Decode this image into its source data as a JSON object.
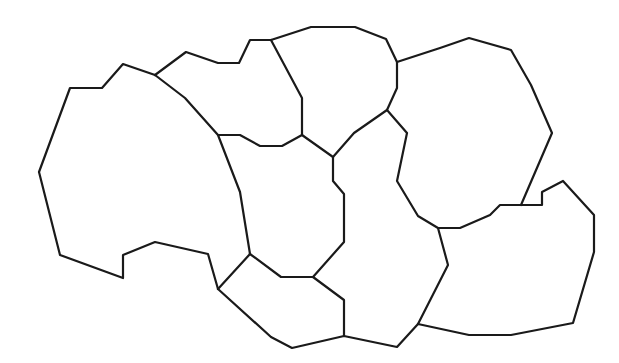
{
  "diagram": {
    "type": "region-outline-map",
    "width": 619,
    "height": 363,
    "background": "#ffffff",
    "stroke_color": "#1a1a1a",
    "segments": [
      {
        "name": "outer-west-boundary",
        "points": [
          [
            155,
            75
          ],
          [
            123,
            64
          ],
          [
            102,
            88
          ],
          [
            70,
            88
          ],
          [
            39,
            172
          ],
          [
            60,
            255
          ],
          [
            123,
            278
          ],
          [
            123,
            255
          ],
          [
            155,
            242
          ],
          [
            208,
            254
          ],
          [
            218,
            289
          ]
        ]
      },
      {
        "name": "west-east-divider",
        "points": [
          [
            155,
            75
          ],
          [
            185,
            98
          ],
          [
            218,
            135
          ],
          [
            240,
            192
          ],
          [
            250,
            254
          ]
        ]
      },
      {
        "name": "outer-north-west-boundary",
        "points": [
          [
            155,
            75
          ],
          [
            186,
            52
          ],
          [
            218,
            63
          ],
          [
            239,
            63
          ],
          [
            250,
            40
          ],
          [
            271,
            40
          ]
        ]
      },
      {
        "name": "north-region-divider",
        "points": [
          [
            271,
            40
          ],
          [
            302,
            98
          ],
          [
            302,
            135
          ]
        ]
      },
      {
        "name": "north-region-bottom",
        "points": [
          [
            218,
            135
          ],
          [
            240,
            135
          ],
          [
            260,
            146
          ],
          [
            282,
            146
          ],
          [
            302,
            135
          ]
        ]
      },
      {
        "name": "outer-north-boundary",
        "points": [
          [
            271,
            40
          ],
          [
            311,
            27
          ],
          [
            355,
            27
          ],
          [
            386,
            39
          ],
          [
            397,
            62
          ]
        ]
      },
      {
        "name": "outer-north-east-boundary",
        "points": [
          [
            397,
            62
          ],
          [
            440,
            48
          ],
          [
            469,
            38
          ],
          [
            511,
            50
          ],
          [
            531,
            85
          ],
          [
            552,
            133
          ],
          [
            521,
            205
          ]
        ]
      },
      {
        "name": "north-central-east-divider",
        "points": [
          [
            397,
            62
          ],
          [
            397,
            88
          ],
          [
            387,
            110
          ]
        ]
      },
      {
        "name": "north-central-bottom",
        "points": [
          [
            302,
            135
          ],
          [
            333,
            157
          ],
          [
            354,
            133
          ],
          [
            387,
            110
          ]
        ]
      },
      {
        "name": "east-region-west-divider",
        "points": [
          [
            387,
            110
          ],
          [
            407,
            133
          ],
          [
            397,
            181
          ],
          [
            418,
            216
          ],
          [
            438,
            228
          ],
          [
            460,
            228
          ],
          [
            490,
            215
          ],
          [
            500,
            205
          ],
          [
            521,
            205
          ]
        ]
      },
      {
        "name": "outer-east-boundary",
        "points": [
          [
            521,
            205
          ],
          [
            542,
            205
          ],
          [
            542,
            192
          ],
          [
            563,
            181
          ],
          [
            594,
            215
          ],
          [
            594,
            252
          ],
          [
            573,
            323
          ],
          [
            511,
            335
          ],
          [
            469,
            335
          ],
          [
            418,
            324
          ]
        ]
      },
      {
        "name": "south-east-divider",
        "points": [
          [
            438,
            228
          ],
          [
            448,
            265
          ],
          [
            418,
            324
          ]
        ]
      },
      {
        "name": "central-column-divider",
        "points": [
          [
            333,
            157
          ],
          [
            333,
            181
          ],
          [
            344,
            194
          ],
          [
            344,
            242
          ],
          [
            313,
            277
          ]
        ]
      },
      {
        "name": "central-south-divider",
        "points": [
          [
            250,
            254
          ],
          [
            281,
            277
          ],
          [
            313,
            277
          ],
          [
            344,
            300
          ],
          [
            344,
            336
          ]
        ]
      },
      {
        "name": "south-west-divider",
        "points": [
          [
            218,
            289
          ],
          [
            250,
            254
          ]
        ]
      },
      {
        "name": "outer-south-boundary",
        "points": [
          [
            218,
            289
          ],
          [
            271,
            337
          ],
          [
            292,
            348
          ],
          [
            344,
            336
          ],
          [
            397,
            347
          ],
          [
            418,
            324
          ]
        ]
      }
    ]
  }
}
